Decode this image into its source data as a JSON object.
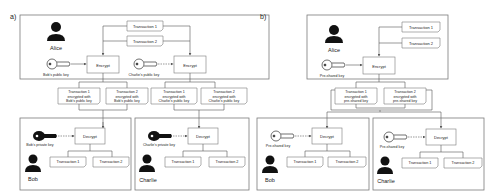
{
  "panels": [
    {
      "label": "a)",
      "sender": {
        "name": "Alice"
      },
      "transactions": [
        "Transaction 1",
        "Transaction 2"
      ],
      "encrypt_blocks": [
        {
          "label": "Encrypt",
          "key_label": "Bob's public key"
        },
        {
          "label": "Encrypt",
          "key_label": "Charlie's public key"
        }
      ],
      "encrypted": [
        [
          "Transaction 1",
          "encrypted with",
          "Bob's public key"
        ],
        [
          "Transaction 2",
          "encrypted with",
          "Bob's public key"
        ],
        [
          "Transaction 1",
          "encrypted with",
          "Charlie's public key"
        ],
        [
          "Transaction 2",
          "encrypted with",
          "Charlie's public key"
        ]
      ],
      "receivers": [
        {
          "name": "Bob",
          "decrypt_label": "Decrypt",
          "key_label": "Bob's private key",
          "outputs": [
            "Transaction 1",
            "Transaction 2"
          ]
        },
        {
          "name": "Charlie",
          "decrypt_label": "Decrypt",
          "key_label": "Charlie's private key",
          "outputs": [
            "Transaction 1",
            "Transaction 2"
          ]
        }
      ]
    },
    {
      "label": "b)",
      "sender": {
        "name": "Alice"
      },
      "transactions": [
        "Transaction 1",
        "Transaction 2"
      ],
      "encrypt_blocks": [
        {
          "label": "Encrypt",
          "key_label": "Pre-shared key"
        }
      ],
      "encrypted": [
        [
          "Transaction 1",
          "encrypted with",
          "pre-shared key"
        ],
        [
          "Transaction 2",
          "encrypted with",
          "pre-shared key"
        ]
      ],
      "receivers": [
        {
          "name": "Bob",
          "decrypt_label": "Decrypt",
          "key_label": "Pre-shared key",
          "outputs": [
            "Transaction 1",
            "Transaction 2"
          ]
        },
        {
          "name": "Charlie",
          "decrypt_label": "Decrypt",
          "key_label": "Pre-shared key",
          "outputs": [
            "Transaction 1",
            "Transaction 2"
          ]
        }
      ]
    }
  ],
  "colors": {
    "stroke": "#7a7a7a",
    "ink": "#111111",
    "text": "#222222"
  }
}
